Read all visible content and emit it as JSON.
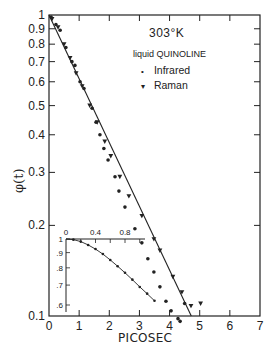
{
  "chart_data": [
    {
      "type": "scatter",
      "title": "",
      "annotations": [
        "303°K",
        "liquid QUINOLINE"
      ],
      "xlabel": "PICOSEC",
      "ylabel": "φ(t)",
      "xscale": "linear",
      "yscale": "log",
      "xlim": [
        0,
        7
      ],
      "ylim": [
        0.1,
        1
      ],
      "xticks": [
        "0",
        "1",
        "2",
        "3",
        "4",
        "5",
        "6",
        "7"
      ],
      "yticks": [
        "1",
        "0.9",
        "0.8",
        "0.7",
        "0.6",
        "0.5",
        "0.4",
        "0.3",
        "0.2",
        "0.1"
      ],
      "grid": false,
      "legend_position": "upper right",
      "legend": [
        {
          "marker": "dot",
          "label": "Infrared"
        },
        {
          "marker": "triangle-down",
          "label": "Raman"
        }
      ],
      "series": [
        {
          "name": "Infrared",
          "marker": "dot",
          "x": [
            0.07,
            0.23,
            0.37,
            0.56,
            0.76,
            0.86,
            1.03,
            1.16,
            1.43,
            1.56,
            1.69,
            1.82,
            1.96,
            2.19,
            2.32,
            2.52,
            2.85,
            3.08,
            3.28,
            3.48,
            3.68,
            3.88,
            4.05,
            4.28,
            4.35,
            4.5
          ],
          "y": [
            0.985,
            0.93,
            0.89,
            0.78,
            0.7,
            0.68,
            0.6,
            0.57,
            0.49,
            0.44,
            0.4,
            0.36,
            0.33,
            0.29,
            0.26,
            0.23,
            0.195,
            0.175,
            0.155,
            0.14,
            0.125,
            0.112,
            0.104,
            0.098,
            0.096,
            0.11
          ]
        },
        {
          "name": "Raman",
          "marker": "triangle-down",
          "x": [
            0.1,
            0.3,
            0.5,
            0.7,
            0.9,
            1.1,
            1.35,
            1.6,
            1.85,
            2.05,
            2.35,
            2.65,
            3.08,
            3.48,
            3.68,
            4.11,
            4.41,
            4.71,
            5.03
          ],
          "y": [
            0.97,
            0.91,
            0.8,
            0.72,
            0.64,
            0.58,
            0.5,
            0.44,
            0.38,
            0.34,
            0.29,
            0.25,
            0.215,
            0.18,
            0.165,
            0.135,
            0.12,
            0.108,
            0.11
          ]
        },
        {
          "name": "Fit line",
          "marker": "none",
          "x": [
            0.0,
            4.72
          ],
          "y": [
            1.0,
            0.1
          ]
        }
      ],
      "inset": {
        "type": "scatter",
        "xscale": "linear",
        "yscale": "log",
        "xticks": [
          "0",
          "0.4",
          "0.8"
        ],
        "yticks": [
          "1",
          ".9",
          ".8",
          ".7",
          ".6"
        ],
        "xlim": [
          0,
          1.2
        ],
        "ylim": [
          0.58,
          1.0
        ],
        "series": [
          {
            "name": "Infrared (short time)",
            "marker": "dot",
            "x": [
              0.0,
              0.1,
              0.2,
              0.3,
              0.4,
              0.5,
              0.6,
              0.7,
              0.8,
              0.9,
              1.0,
              1.1,
              1.2
            ],
            "y": [
              1.0,
              0.995,
              0.98,
              0.955,
              0.925,
              0.89,
              0.85,
              0.81,
              0.77,
              0.73,
              0.69,
              0.655,
              0.62
            ]
          }
        ]
      }
    }
  ],
  "legend": {
    "temperature": "303°K",
    "subtitle": "liquid QUINOLINE",
    "items": [
      {
        "marker": "•",
        "label": "Infrared"
      },
      {
        "marker": "▾",
        "label": "Raman"
      }
    ]
  },
  "axes": {
    "xlabel": "PICOSEC",
    "ylabel": "φ(t)",
    "xticks": [
      "0",
      "1",
      "2",
      "3",
      "4",
      "5",
      "6",
      "7"
    ],
    "yticks": [
      "1",
      "0.9",
      "0.8",
      "0.7",
      "0.6",
      "0.5",
      "0.4",
      "0.3",
      "0.2",
      "0.1"
    ],
    "inset_xticks": [
      "0",
      "0.4",
      "0.8"
    ],
    "inset_yticks": [
      "1",
      ".9",
      ".8",
      ".7",
      ".6"
    ]
  },
  "colors": {
    "ink": "#222222",
    "background": "#ffffff"
  }
}
